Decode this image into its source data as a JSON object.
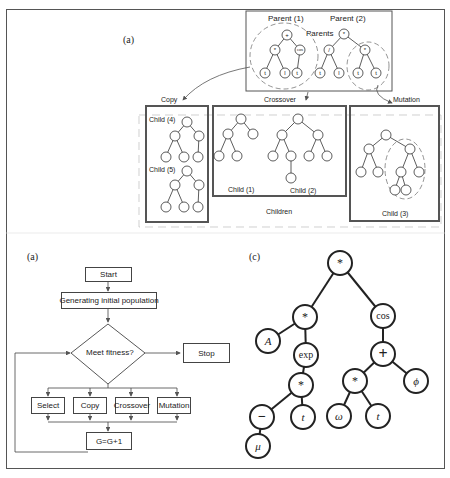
{
  "figure_top": {
    "panel_label": "(a)",
    "parents_box": {
      "label": "Parents",
      "parent1_label": "Parent (1)",
      "parent2_label": "Parent (2)",
      "parent1_tree": {
        "root": "+",
        "children": [
          {
            "op": "*",
            "leaves": [
              "t",
              "l"
            ]
          },
          {
            "op": "cos",
            "leaves": [
              "t"
            ]
          }
        ]
      },
      "parent2_tree": {
        "root": "*",
        "children": [
          {
            "op": "/",
            "leaves": [
              "t",
              "l"
            ]
          },
          {
            "op": "*",
            "leaves": [
              "t",
              "t"
            ]
          }
        ]
      }
    },
    "operations": [
      "Copy",
      "Crossover",
      "Mutation"
    ],
    "children_label": "Children",
    "copy_box": {
      "children": [
        {
          "label": "Child (4)",
          "tree": {
            "root": "+",
            "children": [
              {
                "op": "*",
                "leaves": [
                  "t",
                  "l"
                ]
              },
              {
                "op": "cos",
                "leaves": [
                  "t"
                ]
              }
            ]
          }
        },
        {
          "label": "Child (5)",
          "tree": {
            "root": "+",
            "children": [
              {
                "op": "*",
                "leaves": [
                  "t",
                  "l"
                ]
              },
              {
                "op": "cos",
                "leaves": [
                  "t"
                ]
              }
            ]
          }
        }
      ]
    },
    "crossover_box": {
      "children": [
        {
          "label": "Child (1)",
          "tree": {
            "root": "+",
            "children": [
              {
                "op": "*",
                "leaves": [
                  "t",
                  "l"
                ]
              },
              {
                "leaf": "l"
              }
            ]
          }
        },
        {
          "label": "Child (2)",
          "tree": {
            "root": "*",
            "children": [
              {
                "op": "/",
                "children": [
                  {
                    "leaf": "l"
                  },
                  {
                    "op": "cos",
                    "leaves": [
                      "t"
                    ]
                  }
                ]
              },
              {
                "op": "*",
                "leaves": [
                  "t",
                  "t"
                ]
              }
            ]
          }
        }
      ]
    },
    "mutation_box": {
      "children": [
        {
          "label": "Child (3)",
          "tree": {
            "root": "*",
            "children": [
              {
                "op": "/",
                "leaves": [
                  "t",
                  "l"
                ]
              },
              {
                "op": "*",
                "children": [
                  {
                    "op": "*",
                    "leaves": [
                      "t",
                      "t"
                    ]
                  },
                  {
                    "leaf": "l"
                  }
                ]
              }
            ]
          }
        }
      ]
    }
  },
  "flowchart": {
    "panel_label": "(a)",
    "start": "Start",
    "init": "Generating initial population",
    "decision": "Meet fitness?",
    "stop": "Stop",
    "operations": [
      "Select",
      "Copy",
      "Crossover",
      "Mutation"
    ],
    "increment": "G=G+1"
  },
  "expression_tree": {
    "panel_label": "(c)",
    "nodes": {
      "root": "*",
      "left": "*",
      "A": "A",
      "exp": "exp",
      "mul2": "*",
      "minus": "−",
      "t1": "t",
      "mu": "μ",
      "cos": "cos",
      "plus": "+",
      "mul3": "*",
      "phi": "ϕ",
      "omega": "ω",
      "t2": "t"
    }
  }
}
